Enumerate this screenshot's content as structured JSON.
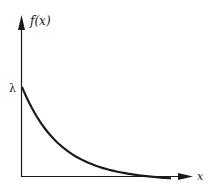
{
  "chart_data": {
    "type": "line",
    "title": "",
    "xlabel": "x",
    "ylabel": "f(x)",
    "y_intercept_label": "λ",
    "function": "f(x) = λ e^(-λx)",
    "grid": false,
    "legend": "none",
    "series": [
      {
        "name": "f(x)",
        "x": [
          0,
          0.5,
          1,
          1.5,
          2,
          2.5,
          3,
          3.5,
          4
        ],
        "values": [
          1.0,
          0.61,
          0.37,
          0.22,
          0.14,
          0.08,
          0.05,
          0.03,
          0.02
        ]
      }
    ],
    "colors": {
      "axes": "#1a1a1a",
      "curve": "#1a1a1a"
    }
  },
  "labels": {
    "y_axis": "f(x)",
    "x_axis": "x",
    "intercept": "λ"
  }
}
